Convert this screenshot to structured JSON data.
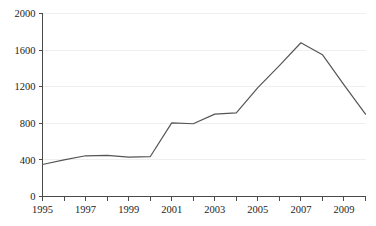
{
  "chart_data": {
    "type": "line",
    "title": "",
    "subtitle": "",
    "xlabel": "",
    "ylabel": "",
    "grid": true,
    "legend": "none",
    "x": [
      1995,
      1996,
      1997,
      1998,
      1999,
      2000,
      2001,
      2002,
      2003,
      2004,
      2005,
      2006,
      2007,
      2008,
      2009,
      2010
    ],
    "categories": [
      "1995",
      "1996",
      "1997",
      "1998",
      "1999",
      "2000",
      "2001",
      "2002",
      "2003",
      "2004",
      "2005",
      "2006",
      "2007",
      "2008",
      "2009",
      "2010"
    ],
    "values": [
      350,
      400,
      445,
      450,
      430,
      435,
      805,
      795,
      900,
      915,
      1190,
      1430,
      1680,
      1550,
      1220,
      900
    ],
    "series": [
      {
        "name": "series-1",
        "color": "#555555",
        "values": [
          350,
          400,
          445,
          450,
          430,
          435,
          805,
          795,
          900,
          915,
          1190,
          1430,
          1680,
          1550,
          1220,
          900
        ]
      }
    ],
    "xlim": [
      1995,
      2010
    ],
    "ylim": [
      0,
      2000
    ],
    "y_ticks": [
      0,
      400,
      800,
      1200,
      1600,
      2000
    ],
    "y_tick_labels": [
      "0",
      "400",
      "800",
      "1200",
      "1600",
      "2000"
    ],
    "x_ticks": [
      1995,
      1996,
      1997,
      1998,
      1999,
      2000,
      2001,
      2002,
      2003,
      2004,
      2005,
      2006,
      2007,
      2008,
      2009,
      2010
    ],
    "x_tick_labels_shown": [
      "1995",
      "1997",
      "1999",
      "2001",
      "2003",
      "2005",
      "2007",
      "2009"
    ],
    "colors": {
      "line": "#555555",
      "axis": "#4a4a4a",
      "grid": "#f2eeee",
      "text": "#1c1c1c",
      "background": "#ffffff"
    }
  }
}
